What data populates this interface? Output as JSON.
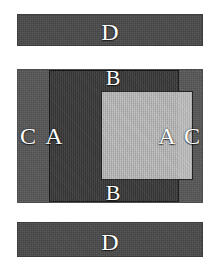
{
  "figure": {
    "background_color": "#ffffff",
    "width": 218,
    "height": 269
  },
  "palette": {
    "bar_gray": "#4a4a4a",
    "outer_gray": "#575757",
    "frame_dark": "#333333",
    "core_light": "#c8c8c8",
    "outline_black": "#141414",
    "label_white": "#ffffff"
  },
  "regions": {
    "bar_top": {
      "label": "D",
      "region_name": "top detached layer"
    },
    "bar_bottom": {
      "label": "D",
      "region_name": "bottom detached layer"
    },
    "outer_left": {
      "label": "C",
      "region_name": "outer left layer"
    },
    "outer_right": {
      "label": "C",
      "region_name": "outer right layer"
    },
    "frame_left": {
      "label": "A",
      "region_name": "inner left wall"
    },
    "frame_right": {
      "label": "A",
      "region_name": "inner right wall"
    },
    "frame_top": {
      "label": "B",
      "region_name": "inner top band"
    },
    "frame_bottom": {
      "label": "B",
      "region_name": "inner bottom band"
    },
    "core": {
      "label": "",
      "region_name": "light central core"
    }
  }
}
